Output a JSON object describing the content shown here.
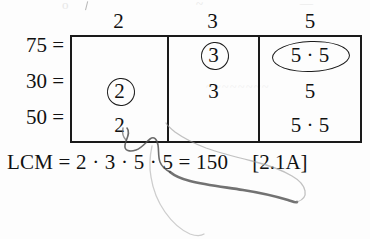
{
  "page": {
    "background_color": "#fdfdfd",
    "ink_color": "#111111",
    "exercise_ref": "[2.1A]"
  },
  "bleed_through": {
    "top_left": "o",
    "top_mid": "~",
    "top_right": "—",
    "middle": "~~~~~~~~"
  },
  "table": {
    "column_headers": [
      "2",
      "3",
      "5"
    ],
    "row_labels": [
      "75 =",
      "30 =",
      "50 ="
    ],
    "rows": [
      {
        "label": "75 =",
        "cells": [
          {
            "text": "",
            "annotation": "none"
          },
          {
            "text": "3",
            "annotation": "circled"
          },
          {
            "text": "5 · 5",
            "annotation": "ellipsed"
          }
        ]
      },
      {
        "label": "30 =",
        "cells": [
          {
            "text": "2",
            "annotation": "circled"
          },
          {
            "text": "3",
            "annotation": "none"
          },
          {
            "text": "5",
            "annotation": "none"
          }
        ]
      },
      {
        "label": "50 =",
        "cells": [
          {
            "text": "2",
            "annotation": "none"
          },
          {
            "text": "",
            "annotation": "none"
          },
          {
            "text": "5 · 5",
            "annotation": "none"
          }
        ]
      }
    ]
  },
  "result": {
    "expression": "LCM = 2 · 3 · 5 · 5 = 150",
    "reference": "[2.1A]"
  }
}
